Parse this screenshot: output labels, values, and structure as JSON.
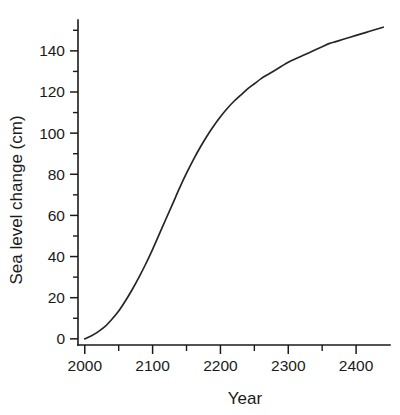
{
  "chart_data": {
    "type": "line",
    "title": "",
    "xlabel": "Year",
    "ylabel": "Sea level change (cm)",
    "xlim": [
      1990,
      2450
    ],
    "ylim": [
      -3,
      155
    ],
    "grid": false,
    "legend": null,
    "x_ticklabels": [
      "2000",
      "2100",
      "2200",
      "2300",
      "2400"
    ],
    "x_tickvalues": [
      2000,
      2100,
      2200,
      2300,
      2400
    ],
    "x_minor_tickvalues": [
      2050,
      2150,
      2250,
      2350
    ],
    "y_ticklabels": [
      "0",
      "20",
      "40",
      "60",
      "80",
      "100",
      "120",
      "140"
    ],
    "y_tickvalues": [
      0,
      20,
      40,
      60,
      80,
      100,
      120,
      140
    ],
    "y_minor_tickvalues": [
      10,
      30,
      50,
      70,
      90,
      110,
      130,
      150
    ],
    "series": [
      {
        "name": "Sea level change",
        "color": "#262626",
        "x": [
          2000,
          2010,
          2020,
          2030,
          2040,
          2050,
          2060,
          2070,
          2080,
          2090,
          2100,
          2110,
          2120,
          2130,
          2140,
          2150,
          2160,
          2170,
          2180,
          2190,
          2200,
          2210,
          2220,
          2230,
          2240,
          2250,
          2260,
          2270,
          2280,
          2290,
          2300,
          2310,
          2320,
          2330,
          2340,
          2350,
          2360,
          2370,
          2380,
          2390,
          2400,
          2410,
          2420,
          2430,
          2440
        ],
        "y": [
          0,
          1.5,
          3.5,
          6,
          9.5,
          13.5,
          18.5,
          24,
          30,
          36.5,
          43.5,
          51,
          58.5,
          66,
          73.5,
          80.5,
          87,
          93,
          98.5,
          103.5,
          108,
          112,
          115.5,
          118.5,
          121.5,
          124,
          126.5,
          128.5,
          130.5,
          132.5,
          134.5,
          136,
          137.5,
          139,
          140.5,
          142,
          143.5,
          144.5,
          145.5,
          146.5,
          147.5,
          148.5,
          149.5,
          150.5,
          151.5
        ]
      }
    ]
  }
}
